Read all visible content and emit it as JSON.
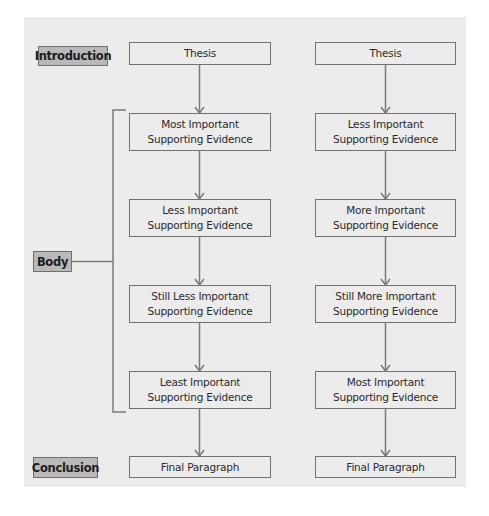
{
  "diagram": {
    "type": "flowchart",
    "section_labels": {
      "introduction": "Introduction",
      "body": "Body",
      "conclusion": "Conclusion"
    },
    "columns": [
      {
        "name": "decreasing-importance",
        "nodes": [
          {
            "line1": "Thesis",
            "line2": ""
          },
          {
            "line1": "Most Important",
            "line2": "Supporting Evidence"
          },
          {
            "line1": "Less Important",
            "line2": "Supporting Evidence"
          },
          {
            "line1": "Still Less Important",
            "line2": "Supporting Evidence"
          },
          {
            "line1": "Least Important",
            "line2": "Supporting Evidence"
          },
          {
            "line1": "Final Paragraph",
            "line2": ""
          }
        ]
      },
      {
        "name": "increasing-importance",
        "nodes": [
          {
            "line1": "Thesis",
            "line2": ""
          },
          {
            "line1": "Less Important",
            "line2": "Supporting Evidence"
          },
          {
            "line1": "More Important",
            "line2": "Supporting Evidence"
          },
          {
            "line1": "Still More Important",
            "line2": "Supporting Evidence"
          },
          {
            "line1": "Most Important",
            "line2": "Supporting Evidence"
          },
          {
            "line1": "Final Paragraph",
            "line2": ""
          }
        ]
      }
    ],
    "colors": {
      "panel_background": "#ececec",
      "label_fill": "#b9b9b9",
      "stroke": "#727272",
      "text": "#2a2a2a"
    }
  }
}
